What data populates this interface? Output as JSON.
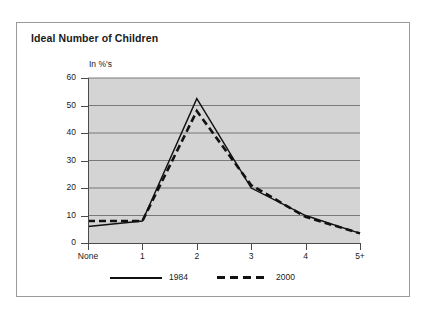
{
  "figure": {
    "background_color": "#ffffff",
    "border_color": "#9a9a9a",
    "plot_background_color": "#d4d4d4"
  },
  "title": "Ideal Number of Children",
  "axis_unit_label": "In %'s",
  "legend": {
    "entries": [
      {
        "label": "1984",
        "style": "solid",
        "color": "#111111"
      },
      {
        "label": "2000",
        "style": "dashed",
        "color": "#111111"
      }
    ]
  },
  "y_axis": {
    "ticks": [
      "0",
      "10",
      "20",
      "30",
      "40",
      "50",
      "60"
    ]
  },
  "x_axis": {
    "ticks": [
      "None",
      "1",
      "2",
      "3",
      "4",
      "5+"
    ]
  },
  "chart_data": {
    "type": "line",
    "title": "Ideal Number of Children",
    "xlabel": "",
    "ylabel": "In %'s",
    "categories": [
      "None",
      "1",
      "2",
      "3",
      "4",
      "5+"
    ],
    "series": [
      {
        "name": "1984",
        "style": "solid",
        "color": "#111111",
        "values": [
          6,
          8,
          52.5,
          20,
          10,
          3.5
        ]
      },
      {
        "name": "2000",
        "style": "dashed",
        "color": "#111111",
        "values": [
          8,
          8,
          48,
          21,
          9.5,
          3.5
        ]
      }
    ],
    "ylim": [
      0,
      60
    ],
    "yticks": [
      0,
      10,
      20,
      30,
      40,
      50,
      60
    ],
    "grid": true,
    "grid_axis": "y",
    "legend_position": "bottom"
  }
}
